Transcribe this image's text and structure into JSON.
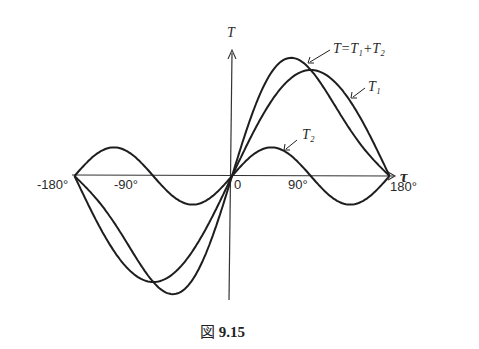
{
  "figure": {
    "caption_prefix": "図",
    "caption_number": "9.15",
    "y_axis_label": "T",
    "x_axis_label": "τ",
    "annotation_sum": "T=T₁+T₂",
    "annotation_t1": "T₁",
    "annotation_t2": "T₂",
    "tick_labels": {
      "neg180": "-180°",
      "neg90": "-90°",
      "zero": "0",
      "pos90": "90°",
      "pos180": "180°"
    }
  },
  "chart_data": {
    "type": "line",
    "title": "図 9.15",
    "xlabel": "τ",
    "ylabel": "T",
    "xlim": [
      -180,
      180
    ],
    "x_ticks": [
      -180,
      -90,
      0,
      90,
      180
    ],
    "x_tick_labels": [
      "-180°",
      "-90°",
      "0",
      "90°",
      "180°"
    ],
    "grid": false,
    "series": [
      {
        "name": "T₁",
        "formula": "1.0·sin(τ)",
        "amplitude": 1.0,
        "harmonic": 1
      },
      {
        "name": "T₂",
        "formula": "0.27·sin(2τ)",
        "amplitude": 0.27,
        "harmonic": 2
      },
      {
        "name": "T=T₁+T₂",
        "formula": "sin(τ)+0.27·sin(2τ)"
      }
    ],
    "x": [
      -180,
      -135,
      -90,
      -45,
      0,
      45,
      90,
      135,
      180
    ],
    "values": {
      "T1": [
        0,
        -0.71,
        -1.0,
        -0.71,
        0,
        0.71,
        1.0,
        0.71,
        0
      ],
      "T2": [
        0,
        0.27,
        0,
        -0.27,
        0,
        0.27,
        0,
        -0.27,
        0
      ],
      "T": [
        0,
        -0.44,
        -1.0,
        -0.98,
        0,
        0.98,
        1.0,
        0.44,
        0
      ]
    }
  }
}
